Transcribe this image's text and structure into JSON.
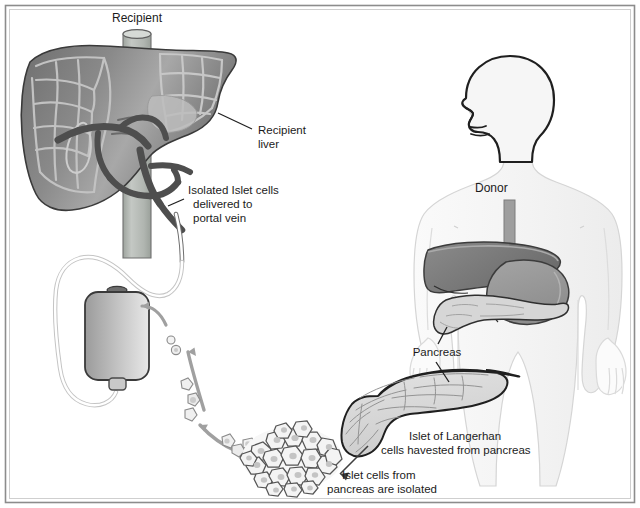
{
  "figure": {
    "border_color": "#8c8c8c",
    "background_color": "#ffffff",
    "ink_color": "#1b1b1b"
  },
  "labels": {
    "recipient": "Recipient",
    "recipient_liver_line1": "Recipient",
    "recipient_liver_line2": "liver",
    "isolated_islet_line1": "Isolated Islet cells",
    "isolated_islet_line2": "delivered to",
    "isolated_islet_line3": "portal vein",
    "donor": "Donor",
    "pancreas": "Pancreas",
    "islet_harvest_line1": "Islet of Langerhan",
    "islet_harvest_line2": "cells havested from pancreas",
    "islet_isolated_line1": "Islet cells from",
    "islet_isolated_line2": "pancreas are isolated"
  },
  "structures": {
    "recipient_liver": {
      "name": "Recipient liver",
      "fill": "#8e8e8e"
    },
    "inferior_vena_cava": {
      "name": "Inferior vena cava",
      "fill": "#b9bdb9"
    },
    "portal_vein": {
      "name": "Portal vein",
      "fill": "#6e6e6e"
    },
    "iv_bag": {
      "name": "IV bag of isolated islet cells",
      "fill": "#b4b4b4"
    },
    "catheter_tubing": {
      "name": "Catheter tubing",
      "fill": "#ffffff"
    },
    "islet_cluster": {
      "name": "Islet of Langerhans cell cluster",
      "fill": "#f2f2f2"
    },
    "donor_body": {
      "name": "Donor body silhouette",
      "fill": "#f4f4f4"
    },
    "donor_liver": {
      "name": "Donor liver",
      "fill": "#7d7d7d"
    },
    "donor_stomach": {
      "name": "Donor stomach",
      "fill": "#9a9a9a"
    },
    "donor_pancreas": {
      "name": "Donor pancreas",
      "fill": "#d3d3d3"
    },
    "enlarged_pancreas": {
      "name": "Enlarged pancreas",
      "fill": "#dcdcdc"
    },
    "esophagus": {
      "name": "Esophagus",
      "fill": "#9e9e9e"
    },
    "transfer_arrows": {
      "name": "Cell transfer arrows",
      "fill": "#9b9b9b"
    }
  },
  "icons": {
    "leader_line": "leader-line-icon",
    "arrow": "arrow-icon"
  }
}
